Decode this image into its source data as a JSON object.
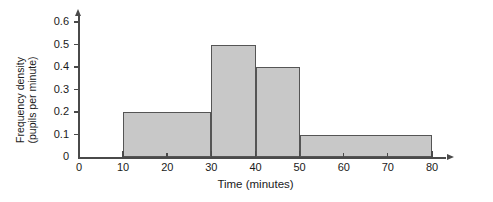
{
  "chart_data": {
    "type": "bar",
    "title": "",
    "subtitle": "",
    "xlabel": "Time (minutes)",
    "ylabel_line1": "Frequency density",
    "ylabel_line2": "(pupils per minute)",
    "ylabel": "Frequency density (pupils per minute)",
    "xlim": [
      0,
      80
    ],
    "ylim": [
      0,
      0.6
    ],
    "grid": false,
    "legend": null,
    "xticks": [
      0,
      10,
      20,
      30,
      40,
      50,
      60,
      70,
      80
    ],
    "xtick_labels": [
      "0",
      "10",
      "20",
      "30",
      "40",
      "50",
      "60",
      "70",
      "80"
    ],
    "yticks": [
      0,
      0.1,
      0.2,
      0.3,
      0.4,
      0.5,
      0.6
    ],
    "ytick_labels": [
      "0",
      "0.1",
      "0.2",
      "0.3",
      "0.4",
      "0.5",
      "0.6"
    ],
    "bin_edges": [
      10,
      30,
      40,
      50,
      80
    ],
    "categories": [
      "10-30",
      "30-40",
      "40-50",
      "50-80"
    ],
    "values": [
      0.2,
      0.5,
      0.4,
      0.1
    ],
    "bars": [
      {
        "label": "10-30",
        "x0": 10,
        "x1": 30,
        "height": 0.2
      },
      {
        "label": "30-40",
        "x0": 30,
        "x1": 40,
        "height": 0.5
      },
      {
        "label": "40-50",
        "x0": 40,
        "x1": 50,
        "height": 0.4
      },
      {
        "label": "50-80",
        "x0": 50,
        "x1": 80,
        "height": 0.1
      }
    ],
    "colors": {
      "bar_fill": "#c8c8c8",
      "bar_border": "#555555",
      "axis": "#4a4a4a",
      "text": "#1a1a1a",
      "background": "#ffffff"
    }
  }
}
